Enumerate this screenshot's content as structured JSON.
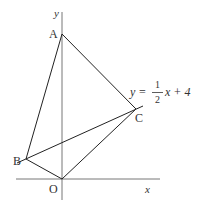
{
  "diagram": {
    "axes": {
      "x_label": "x",
      "y_label": "y",
      "origin_label": "O"
    },
    "points": {
      "A": {
        "label": "A"
      },
      "B": {
        "label": "B"
      },
      "C": {
        "label": "C"
      },
      "O": {
        "label": "O"
      }
    },
    "line_equation": {
      "lhs": "y",
      "equals": "=",
      "numerator": "1",
      "denominator": "2",
      "rest": "x + 4"
    },
    "colors": {
      "stroke": "#222222",
      "axis": "#555555",
      "text": "#333333"
    }
  }
}
